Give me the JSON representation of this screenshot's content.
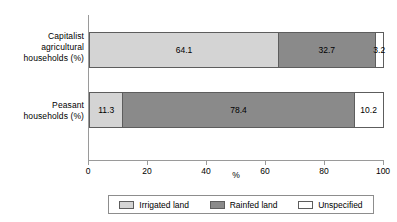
{
  "chart_data": {
    "type": "bar",
    "orientation": "horizontal",
    "stacked": true,
    "stacked_mode": "percent",
    "title": "",
    "xlabel": "%",
    "ylabel": "",
    "xlim": [
      0,
      100
    ],
    "grid": false,
    "legend_position": "bottom",
    "categories": [
      "Capitalist agricultural households (%)",
      "Peasant households (%)"
    ],
    "category_lines": [
      [
        "Capitalist",
        "agricultural",
        "households (%)"
      ],
      [
        "Peasant",
        "households (%)"
      ]
    ],
    "series": [
      {
        "name": "Irrigated land",
        "color": "#d4d4d4",
        "values": [
          64.1,
          11.3
        ]
      },
      {
        "name": "Rainfed land",
        "color": "#8a8a8a",
        "values": [
          32.7,
          78.4
        ]
      },
      {
        "name": "Unspecified",
        "color": "#ffffff",
        "values": [
          3.2,
          10.2
        ]
      }
    ],
    "xticks": [
      0,
      20,
      40,
      60,
      80,
      100
    ],
    "xtick_labels": [
      "0",
      "20",
      "40",
      "60",
      "80",
      "100"
    ],
    "bars": [
      {
        "category_index": 0,
        "segments": [
          {
            "series": "Irrigated land",
            "value": 64.1,
            "label": "64.1"
          },
          {
            "series": "Rainfed land",
            "value": 32.7,
            "label": "32.7"
          },
          {
            "series": "Unspecified",
            "value": 3.2,
            "label": "3.2"
          }
        ]
      },
      {
        "category_index": 1,
        "segments": [
          {
            "series": "Irrigated land",
            "value": 11.3,
            "label": "11.3"
          },
          {
            "series": "Rainfed land",
            "value": 78.4,
            "label": "78.4"
          },
          {
            "series": "Unspecified",
            "value": 10.2,
            "label": "10.2"
          }
        ]
      }
    ]
  },
  "legend": {
    "items": [
      {
        "label": "Irrigated land",
        "color": "#d4d4d4"
      },
      {
        "label": "Rainfed land",
        "color": "#8a8a8a"
      },
      {
        "label": "Unspecified",
        "color": "#ffffff"
      }
    ]
  },
  "colors": {
    "irrigated": "#d4d4d4",
    "rainfed": "#8a8a8a",
    "unspecified": "#ffffff",
    "axis": "#9a9a9a",
    "outline": "#5d5d5d",
    "text": "#000000",
    "background": "#ffffff"
  }
}
